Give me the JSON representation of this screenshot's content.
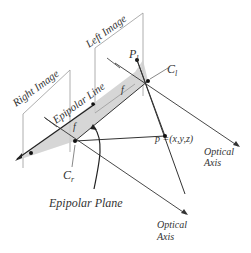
{
  "diagram": {
    "labels": {
      "left_image": "Left Image",
      "right_image": "Right Image",
      "epipolar_line": "Epipolar Line",
      "epipolar_plane": "Epipolar Plane",
      "point_p": "p =(x,y,z)",
      "optical_axis_1_line1": "Optical",
      "optical_axis_1_line2": "Axis",
      "optical_axis_2_line1": "Optical",
      "optical_axis_2_line2": "Axis",
      "cl": "C",
      "cl_sub": "l",
      "cr": "C",
      "cr_sub": "r",
      "pl": "P",
      "pl_sub": "l",
      "f_left": "f",
      "f_right": "f"
    },
    "colors": {
      "line": "#333333",
      "frame": "#888888",
      "plane_fill": "#cfcfcf"
    }
  }
}
